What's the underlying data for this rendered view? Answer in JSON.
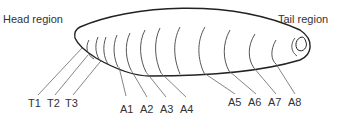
{
  "diagram": {
    "regions": {
      "head": "Head region",
      "tail": "Tail region"
    },
    "segments": {
      "thoracic": [
        "T1",
        "T2",
        "T3"
      ],
      "abdominal": [
        "A1",
        "A2",
        "A3",
        "A4",
        "A5",
        "A6",
        "A7",
        "A8"
      ]
    },
    "colors": {
      "outline": "#222222",
      "segment_lines": "#555555",
      "leader_lines": "#666666",
      "text": "#333333"
    }
  }
}
